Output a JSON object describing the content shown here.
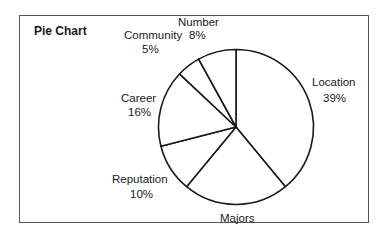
{
  "chart_data": {
    "type": "pie",
    "title": "Pie Chart",
    "start_angle_deg": 0,
    "direction": "clockwise",
    "slices": [
      {
        "label": "Location",
        "value": 39,
        "value_label": "39%"
      },
      {
        "label": "Majors",
        "value": 22,
        "value_label": ""
      },
      {
        "label": "Reputation",
        "value": 10,
        "value_label": "10%"
      },
      {
        "label": "Career",
        "value": 16,
        "value_label": "16%"
      },
      {
        "label": "Community",
        "value": 5,
        "value_label": "5%"
      },
      {
        "label": "Number",
        "value": 8,
        "value_label": "8%"
      }
    ],
    "categories": [
      "Location",
      "Majors",
      "Reputation",
      "Career",
      "Community",
      "Number"
    ],
    "values": [
      39,
      22,
      10,
      16,
      5,
      8
    ],
    "legend": "none",
    "fill": "#ffffff",
    "stroke": "#1a1a1a"
  },
  "labels": {
    "title": "Pie Chart",
    "number": "Number",
    "community": "Community",
    "number_pct": "8%",
    "community_pct": "5%",
    "career": "Career",
    "career_pct": "16%",
    "reputation": "Reputation",
    "reputation_pct": "10%",
    "location": "Location",
    "location_pct": "39%",
    "majors": "Majors"
  }
}
